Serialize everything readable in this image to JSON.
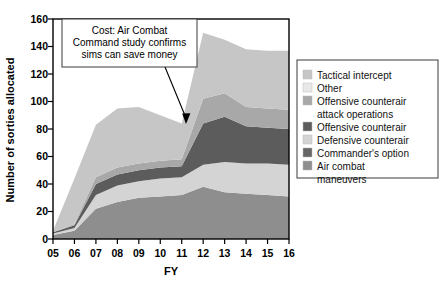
{
  "chart_data": {
    "type": "area",
    "title": "",
    "subtitle": "",
    "xlabel": "FY",
    "ylabel": "Number of sorties allocated",
    "categories": [
      "05",
      "06",
      "07",
      "08",
      "09",
      "10",
      "11",
      "12",
      "13",
      "14",
      "15",
      "16"
    ],
    "x": [
      5,
      6,
      7,
      8,
      9,
      10,
      11,
      12,
      13,
      14,
      15,
      16
    ],
    "xlim": [
      5,
      16
    ],
    "ylim": [
      0,
      160
    ],
    "yticks": [
      0,
      20,
      40,
      60,
      80,
      100,
      120,
      140,
      160
    ],
    "grid": false,
    "stacked": true,
    "legend_position": "right",
    "series": [
      {
        "name": "Air combat maneuvers",
        "color": "#8e8e8e",
        "values": [
          3,
          6,
          22,
          27,
          30,
          31,
          32,
          38,
          34,
          33,
          32,
          31
        ]
      },
      {
        "name": "Commander's option",
        "color": "#666666",
        "values": [
          0,
          0,
          0,
          0,
          0,
          0,
          0,
          0,
          0,
          0,
          0,
          0
        ]
      },
      {
        "name": "Defensive counterair",
        "color": "#d4d4d4",
        "values": [
          1,
          2,
          10,
          12,
          12,
          13,
          13,
          16,
          22,
          22,
          23,
          23
        ]
      },
      {
        "name": "Offensive counterair",
        "color": "#5c5c5c",
        "values": [
          1,
          2,
          8,
          8,
          8,
          8,
          8,
          30,
          33,
          27,
          26,
          26
        ]
      },
      {
        "name": "Offensive counterair attack operations",
        "color": "#a8a8a8",
        "values": [
          0,
          1,
          5,
          5,
          5,
          5,
          5,
          18,
          17,
          14,
          14,
          14
        ]
      },
      {
        "name": "Other",
        "color": "#e8e8e8",
        "values": [
          0,
          0,
          0,
          0,
          0,
          0,
          0,
          0,
          0,
          0,
          0,
          0
        ]
      },
      {
        "name": "Tactical intercept",
        "color": "#c6c6c6",
        "values": [
          1,
          33,
          38,
          43,
          41,
          33,
          26,
          48,
          39,
          42,
          42,
          43
        ]
      }
    ],
    "totals": [
      6,
      44,
      83,
      95,
      96,
      90,
      84,
      150,
      145,
      138,
      137,
      137
    ],
    "annotations": [
      {
        "name": "cost-callout",
        "lines": [
          "Cost: Air Combat",
          "Command study confirms",
          "sims can save money"
        ],
        "arrow_target_x": 11,
        "arrow_target_y": 84
      }
    ]
  },
  "legend": {
    "items": [
      {
        "label": "Tactical intercept",
        "color": "#c6c6c6"
      },
      {
        "label": "Other",
        "color": "#e8e8e8"
      },
      {
        "label": "Offensive counterair",
        "label2": "attack operations",
        "color": "#a8a8a8"
      },
      {
        "label": "Offensive counterair",
        "color": "#5c5c5c"
      },
      {
        "label": "Defensive counterair",
        "color": "#d4d4d4"
      },
      {
        "label": "Commander's option",
        "color": "#666666"
      },
      {
        "label": "Air combat",
        "label2": "maneuvers",
        "color": "#8e8e8e"
      }
    ]
  },
  "axes": {
    "y_title": "Number of sorties allocated",
    "x_title": "FY",
    "y_ticks": [
      "160",
      "140",
      "120",
      "100",
      "80",
      "60",
      "40",
      "20",
      "0"
    ],
    "x_ticks": [
      "05",
      "06",
      "07",
      "08",
      "09",
      "10",
      "11",
      "12",
      "13",
      "14",
      "15",
      "16"
    ]
  },
  "annotation": {
    "line1": "Cost: Air Combat",
    "line2": "Command study confirms",
    "line3": "sims can save money"
  }
}
